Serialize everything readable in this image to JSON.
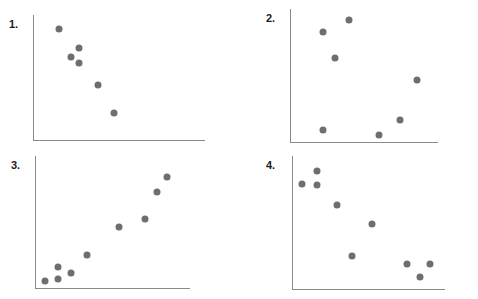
{
  "page": {
    "background_color": "#ffffff",
    "width": 478,
    "height": 299
  },
  "style": {
    "dot_color": "#6e6e6e",
    "axis_color": "#8a8a8a",
    "label_color": "#1b1b1b"
  },
  "panels": [
    {
      "id": "panel-1",
      "label": "1.",
      "label_pos": {
        "x": 9,
        "y": 19
      },
      "axis": {
        "x": 33,
        "y_top": 15,
        "y_bottom": 140,
        "x_right": 205
      },
      "chart_data": {
        "type": "scatter",
        "title": "1.",
        "xlabel": "",
        "ylabel": "",
        "grid": false,
        "legend": "none",
        "correlation": "negative",
        "xlim": [
          0,
          100
        ],
        "ylim": [
          0,
          100
        ],
        "points": [
          {
            "x": 15.1,
            "y": 88.8
          },
          {
            "x": 26.7,
            "y": 73.6
          },
          {
            "x": 22.1,
            "y": 66.4
          },
          {
            "x": 26.7,
            "y": 61.6
          },
          {
            "x": 37.8,
            "y": 44.0
          },
          {
            "x": 47.1,
            "y": 21.6
          }
        ]
      }
    },
    {
      "id": "panel-2",
      "label": "2.",
      "label_pos": {
        "x": 266,
        "y": 13
      },
      "axis": {
        "x": 290,
        "y_top": 9,
        "y_bottom": 142,
        "x_right": 438
      },
      "chart_data": {
        "type": "scatter",
        "title": "2.",
        "xlabel": "",
        "ylabel": "",
        "grid": false,
        "legend": "none",
        "correlation": "none",
        "xlim": [
          0,
          100
        ],
        "ylim": [
          0,
          100
        ],
        "points": [
          {
            "x": 22.3,
            "y": 82.7
          },
          {
            "x": 39.9,
            "y": 91.7
          },
          {
            "x": 30.4,
            "y": 63.2
          },
          {
            "x": 85.8,
            "y": 46.6
          },
          {
            "x": 74.3,
            "y": 16.5
          },
          {
            "x": 22.3,
            "y": 9.0
          },
          {
            "x": 60.1,
            "y": 5.3
          }
        ]
      }
    },
    {
      "id": "panel-3",
      "label": "3.",
      "label_pos": {
        "x": 11,
        "y": 160
      },
      "axis": {
        "x": 35,
        "y_top": 156,
        "y_bottom": 288,
        "x_right": 190
      },
      "chart_data": {
        "type": "scatter",
        "title": "3.",
        "xlabel": "",
        "ylabel": "",
        "grid": false,
        "legend": "none",
        "correlation": "positive",
        "xlim": [
          0,
          100
        ],
        "ylim": [
          0,
          100
        ],
        "points": [
          {
            "x": 6.4,
            "y": 5.3
          },
          {
            "x": 14.7,
            "y": 15.9
          },
          {
            "x": 14.7,
            "y": 6.8
          },
          {
            "x": 23.1,
            "y": 11.4
          },
          {
            "x": 33.3,
            "y": 25.0
          },
          {
            "x": 54.5,
            "y": 46.2
          },
          {
            "x": 71.2,
            "y": 52.3
          },
          {
            "x": 78.8,
            "y": 72.7
          },
          {
            "x": 85.3,
            "y": 84.1
          }
        ]
      }
    },
    {
      "id": "panel-4",
      "label": "4.",
      "label_pos": {
        "x": 266,
        "y": 160
      },
      "axis": {
        "x": 292,
        "y_top": 156,
        "y_bottom": 289,
        "x_right": 445
      },
      "chart_data": {
        "type": "scatter",
        "title": "4.",
        "xlabel": "",
        "ylabel": "",
        "grid": false,
        "legend": "none",
        "correlation": "negative",
        "xlim": [
          0,
          100
        ],
        "ylim": [
          0,
          100
        ],
        "points": [
          {
            "x": 6.5,
            "y": 79.0
          },
          {
            "x": 16.3,
            "y": 88.7
          },
          {
            "x": 16.3,
            "y": 78.2
          },
          {
            "x": 29.4,
            "y": 62.9
          },
          {
            "x": 52.3,
            "y": 49.2
          },
          {
            "x": 39.2,
            "y": 25.0
          },
          {
            "x": 75.2,
            "y": 18.6
          },
          {
            "x": 90.2,
            "y": 18.6
          },
          {
            "x": 83.7,
            "y": 8.9
          }
        ]
      }
    }
  ]
}
